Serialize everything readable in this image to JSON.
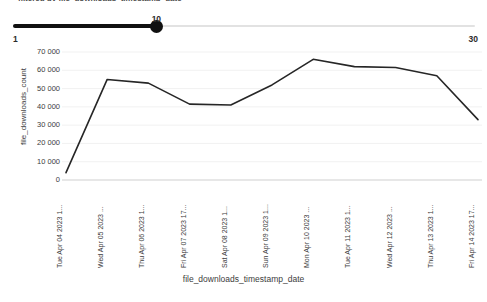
{
  "clipped_caption": "filtered by file_downloads_timestamp_date",
  "slider": {
    "min_label": "1",
    "max_label": "30",
    "value_label": "10",
    "min": 1,
    "max": 30,
    "value": 10,
    "active_color": "#111111",
    "inactive_color": "#e2e2e2"
  },
  "chart_data": {
    "type": "line",
    "title": "",
    "xlabel": "file_downloads_timestamp_date",
    "ylabel": "file_downloads_count",
    "ylim": [
      0,
      70000
    ],
    "grid": true,
    "legend": "none",
    "line_color": "#262626",
    "y_ticks": [
      0,
      10000,
      20000,
      30000,
      40000,
      50000,
      60000,
      70000
    ],
    "y_tick_labels": [
      "0",
      "10 000",
      "20 000",
      "30 000",
      "40 000",
      "50 000",
      "60 000",
      "70 000"
    ],
    "categories": [
      "Tue Apr 04 2023 1...",
      "Wed Apr 05 2023 ...",
      "Thu Apr 06 2023 1...",
      "Fri Apr 07 2023 17...",
      "Sat Apr 08 2023 1...",
      "Sun Apr 09 2023 1...",
      "Mon Apr 10 2023 ...",
      "Tue Apr 11 2023 1...",
      "Wed Apr 12 2023 ...",
      "Thu Apr 13 2023 1...",
      "Fri Apr 14 2023 17..."
    ],
    "values": [
      4000,
      55000,
      53000,
      41500,
      41000,
      52000,
      66000,
      62000,
      61500,
      57000,
      33000
    ]
  }
}
